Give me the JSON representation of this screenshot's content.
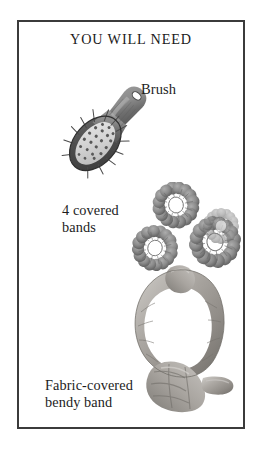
{
  "page": {
    "title": "YOU WILL NEED",
    "background_color": "#ffffff",
    "frame_color": "#3b3b3b",
    "text_color": "#1d1d1d"
  },
  "items": [
    {
      "id": "brush",
      "label": "Brush",
      "illustration": "hair-brush-photo",
      "colors": {
        "handle": "#8e8e8e",
        "handle_shadow": "#4a4a4a",
        "pad": "#d8d8d8",
        "bristle": "#4f4f4f"
      }
    },
    {
      "id": "covered-bands",
      "label": "4 covered\nbands",
      "count": 4,
      "illustration": "covered-hair-bands-photo",
      "colors": {
        "band": "#8a8a8a",
        "band_shadow": "#5e5e5e"
      }
    },
    {
      "id": "bendy-band",
      "label": "Fabric-covered\nbendy band",
      "illustration": "fabric-covered-bendy-band-photo",
      "colors": {
        "fabric": "#a9a7a3",
        "fabric_shadow": "#6f6d69",
        "fabric_highlight": "#cfcdc9"
      }
    }
  ]
}
